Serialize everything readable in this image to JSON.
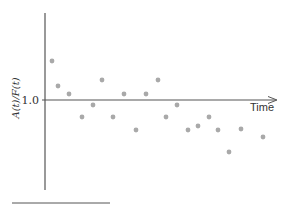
{
  "chart_data": {
    "type": "scatter",
    "title": "",
    "xlabel": "Time",
    "ylabel": "A(t)/F(t)",
    "y_ticks": [
      "1.0"
    ],
    "reference_line": 1.0,
    "grid": false,
    "legend": null,
    "point_color": "#a9a9a9",
    "axis_color": "#555555",
    "series": [
      {
        "name": "ratio",
        "points": [
          {
            "x": 1,
            "y": 1.39
          },
          {
            "x": 2,
            "y": 1.14
          },
          {
            "x": 3,
            "y": 1.06
          },
          {
            "x": 4,
            "y": 0.83
          },
          {
            "x": 5,
            "y": 0.95
          },
          {
            "x": 6,
            "y": 1.2
          },
          {
            "x": 7,
            "y": 0.83
          },
          {
            "x": 8,
            "y": 1.06
          },
          {
            "x": 9,
            "y": 0.7
          },
          {
            "x": 10,
            "y": 1.06
          },
          {
            "x": 11,
            "y": 1.2
          },
          {
            "x": 12,
            "y": 0.83
          },
          {
            "x": 13,
            "y": 0.95
          },
          {
            "x": 14,
            "y": 0.7
          },
          {
            "x": 15,
            "y": 0.74
          },
          {
            "x": 16,
            "y": 0.83
          },
          {
            "x": 17,
            "y": 0.7
          },
          {
            "x": 18,
            "y": 0.48
          },
          {
            "x": 19,
            "y": 0.71
          },
          {
            "x": 20,
            "y": 0.63
          }
        ],
        "pixel_points": [
          [
            52,
            61
          ],
          [
            58,
            86
          ],
          [
            69,
            94
          ],
          [
            82,
            117
          ],
          [
            93,
            105
          ],
          [
            102,
            80
          ],
          [
            113,
            117
          ],
          [
            124,
            94
          ],
          [
            136,
            130
          ],
          [
            146,
            94
          ],
          [
            158,
            80
          ],
          [
            166,
            117
          ],
          [
            177,
            105
          ],
          [
            188,
            130
          ],
          [
            198,
            126
          ],
          [
            209,
            117
          ],
          [
            218,
            130
          ],
          [
            229,
            152
          ],
          [
            241,
            129
          ],
          [
            263,
            137
          ]
        ]
      }
    ]
  }
}
